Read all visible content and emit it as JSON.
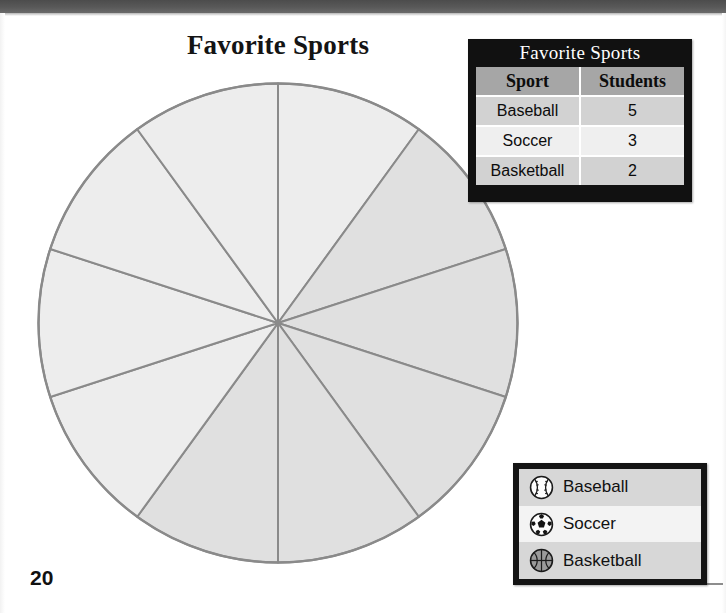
{
  "page": {
    "page_number": "20",
    "background_color": "#ffffff",
    "top_band_color": "#595959"
  },
  "chart": {
    "title": "Favorite Sports"
  },
  "data_table": {
    "title": "Favorite Sports",
    "columns": [
      "Sport",
      "Students"
    ],
    "rows": [
      {
        "sport": "Baseball",
        "students": "5"
      },
      {
        "sport": "Soccer",
        "students": "3"
      },
      {
        "sport": "Basketball",
        "students": "2"
      }
    ],
    "header_bg": "#a6a6a6",
    "title_bg": "#111111",
    "row_bg_a": "#d2d2d2",
    "row_bg_b": "#efefef"
  },
  "legend": {
    "items": [
      {
        "label": "Baseball",
        "icon": "baseball-icon"
      },
      {
        "label": "Soccer",
        "icon": "soccer-ball-icon"
      },
      {
        "label": "Basketball",
        "icon": "basketball-icon"
      }
    ],
    "border_color": "#141414"
  },
  "chart_data": {
    "type": "pie",
    "title": "Favorite Sports",
    "categories": [
      "Baseball",
      "Soccer",
      "Basketball"
    ],
    "values": [
      5,
      3,
      2
    ],
    "total_slices": 10,
    "slice_degrees": 36,
    "unit": "students",
    "note": "Circle divided into 10 equal 36-degree sectors; 5 consecutive sectors on the right/lower-right are shaded darker, the other 5 are light.",
    "shaded_slice_indices": [
      1,
      2,
      3,
      4,
      5
    ],
    "start_angle_deg": 0,
    "slice_fill_light": "#ededed",
    "slice_fill_shaded": "#e0e0e0",
    "slice_stroke": "#8a8a8a",
    "legend_position": "bottom-right",
    "grid": false
  }
}
